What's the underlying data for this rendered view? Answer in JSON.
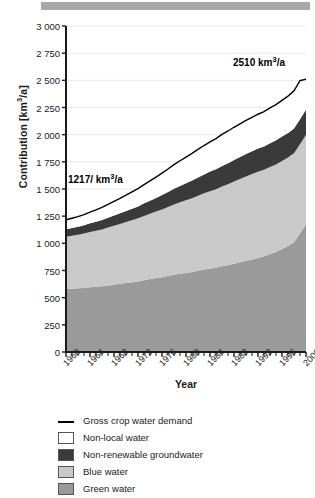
{
  "figure": {
    "top_bar_color": "#a8a8a8"
  },
  "axes": {
    "ylabel": "Contribution [km3/a]",
    "xlabel": "Year",
    "yticks": [
      0,
      250,
      500,
      750,
      1000,
      1250,
      1500,
      1750,
      2000,
      2250,
      2500,
      2750,
      3000
    ],
    "ytick_labels": [
      "0",
      "250",
      "500",
      "750",
      "1 000",
      "1 250",
      "1 500",
      "1 750",
      "2 000",
      "2 250",
      "2 500",
      "2 750",
      "3 000"
    ],
    "xticks": [
      1960,
      1964,
      1968,
      1972,
      1976,
      1980,
      1984,
      1988,
      1992,
      1996,
      2000
    ],
    "xtick_labels": [
      "1960",
      "1964",
      "1968",
      "1972",
      "1976",
      "1980",
      "1984",
      "1988",
      "1992",
      "1996",
      "2000"
    ]
  },
  "annotations": {
    "start_value": "1217/ km",
    "start_sup": "3",
    "start_tail": "/a",
    "end_value": "2510 km",
    "end_sup": "3",
    "end_tail": "/a"
  },
  "legend": {
    "items": [
      {
        "label": "Gross crop water demand",
        "type": "line",
        "color": "#000000"
      },
      {
        "label": "Non-local water",
        "type": "swatch",
        "color": "#ffffff"
      },
      {
        "label": "Non-renewable groundwater",
        "type": "swatch",
        "color": "#3a3a3a"
      },
      {
        "label": "Blue water",
        "type": "swatch",
        "color": "#c9c9c9"
      },
      {
        "label": "Green water",
        "type": "swatch",
        "color": "#9a9a9a"
      }
    ]
  },
  "chart_data": {
    "type": "area",
    "title": "",
    "xlabel": "Year",
    "ylabel": "Contribution [km3/a]",
    "xlim": [
      1960,
      2000
    ],
    "ylim": [
      0,
      3000
    ],
    "grid": true,
    "stacked": true,
    "legend_position": "below",
    "x": [
      1960,
      1961,
      1962,
      1963,
      1964,
      1965,
      1966,
      1967,
      1968,
      1969,
      1970,
      1971,
      1972,
      1973,
      1974,
      1975,
      1976,
      1977,
      1978,
      1979,
      1980,
      1981,
      1982,
      1983,
      1984,
      1985,
      1986,
      1987,
      1988,
      1989,
      1990,
      1991,
      1992,
      1993,
      1994,
      1995,
      1996,
      1997,
      1998,
      1999,
      2000
    ],
    "series": [
      {
        "name": "Green water",
        "color": "#9a9a9a",
        "values": [
          580,
          583,
          586,
          590,
          596,
          600,
          604,
          612,
          620,
          628,
          636,
          640,
          648,
          660,
          672,
          680,
          688,
          700,
          712,
          720,
          726,
          736,
          748,
          760,
          768,
          776,
          790,
          800,
          812,
          826,
          840,
          852,
          866,
          880,
          900,
          920,
          948,
          975,
          1010,
          1090,
          1175
        ]
      },
      {
        "name": "Blue water",
        "color": "#c9c9c9",
        "values": [
          480,
          486,
          492,
          500,
          508,
          516,
          524,
          534,
          542,
          550,
          560,
          572,
          582,
          592,
          600,
          612,
          624,
          634,
          646,
          658,
          670,
          680,
          690,
          700,
          712,
          722,
          732,
          744,
          756,
          766,
          776,
          786,
          792,
          796,
          802,
          806,
          810,
          814,
          818,
          822,
          825
        ]
      },
      {
        "name": "Non-renewable groundwater",
        "color": "#3a3a3a",
        "values": [
          70,
          72,
          74,
          76,
          80,
          82,
          86,
          90,
          94,
          98,
          102,
          106,
          110,
          116,
          120,
          126,
          132,
          138,
          144,
          150,
          156,
          162,
          168,
          174,
          180,
          184,
          190,
          194,
          198,
          202,
          206,
          210,
          214,
          216,
          220,
          222,
          224,
          226,
          228,
          229,
          230
        ]
      },
      {
        "name": "Non-local water",
        "color": "#ffffff",
        "values": [
          87,
          90,
          94,
          98,
          104,
          110,
          116,
          122,
          130,
          138,
          146,
          156,
          164,
          172,
          182,
          192,
          202,
          212,
          222,
          232,
          242,
          250,
          258,
          266,
          274,
          282,
          290,
          296,
          302,
          306,
          310,
          312,
          316,
          320,
          324,
          328,
          334,
          340,
          348,
          356,
          280
        ]
      }
    ],
    "line_series": {
      "name": "Gross crop water demand",
      "color": "#000000",
      "values": [
        1217,
        1231,
        1246,
        1264,
        1288,
        1308,
        1330,
        1358,
        1386,
        1414,
        1444,
        1474,
        1504,
        1540,
        1574,
        1610,
        1646,
        1684,
        1724,
        1760,
        1794,
        1828,
        1864,
        1900,
        1934,
        1964,
        2002,
        2034,
        2068,
        2100,
        2132,
        2160,
        2188,
        2212,
        2246,
        2276,
        2316,
        2355,
        2404,
        2497,
        2510
      ]
    }
  }
}
